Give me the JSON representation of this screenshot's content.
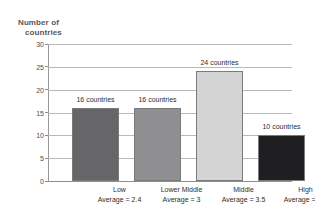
{
  "chart_data": {
    "type": "bar",
    "title": "",
    "xlabel": "",
    "ylabel": "Number of countries",
    "ylabel_lines": [
      "Number of",
      "countries"
    ],
    "ylim": [
      0,
      30
    ],
    "yticks": [
      30,
      25,
      20,
      15,
      10,
      5,
      0
    ],
    "grid": true,
    "legend": "none",
    "categories": [
      "Low",
      "Lower Middle",
      "Middle",
      "High"
    ],
    "values": [
      16,
      16,
      24,
      10
    ],
    "data_labels": [
      "16 countries",
      "16 countries",
      "24 countries",
      "10 countries"
    ],
    "category_sublabels": [
      "Average = 2.4",
      "Average = 3",
      "Average = 3.5",
      "Average = 4.1"
    ],
    "category_averages": [
      2.4,
      3,
      3.5,
      4.1
    ],
    "bar_colors": [
      "#666668",
      "#8f8f91",
      "#d4d4d4",
      "#1f1f21"
    ]
  },
  "axis": {
    "y_title_line1": "Number of",
    "y_title_line2": "countries",
    "tick_30": "30",
    "tick_25": "25",
    "tick_20": "20",
    "tick_15": "15",
    "tick_10": "10",
    "tick_5": "5",
    "tick_0": "0"
  },
  "colors": {
    "gridline": "#b9b9ba",
    "axis_line": "#9a9a9b",
    "text": "#2e2e30",
    "title_text": "#58585a",
    "background": "#ffffff"
  }
}
